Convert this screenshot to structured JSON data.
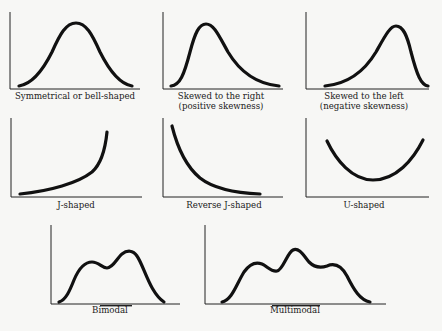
{
  "panels": [
    {
      "id": "symmetrical",
      "label_lines": [
        "Symmetrical or bell-shaped"
      ],
      "shape": "bell"
    },
    {
      "id": "skewed-right",
      "label_lines": [
        "Skewed to the right",
        "(positive skewness)"
      ],
      "shape": "right-skew"
    },
    {
      "id": "skewed-left",
      "label_lines": [
        "Skewed to the left",
        "(negative skewness)"
      ],
      "shape": "left-skew"
    },
    {
      "id": "j-shaped",
      "label_lines": [
        "J-shaped"
      ],
      "shape": "j"
    },
    {
      "id": "reverse-j-shaped",
      "label_lines": [
        "Reverse J-shaped"
      ],
      "shape": "reverse-j"
    },
    {
      "id": "u-shaped",
      "label_lines": [
        "U-shaped"
      ],
      "shape": "u"
    },
    {
      "id": "bimodal",
      "label_lines": [
        "Bimodal"
      ],
      "shape": "bimodal"
    },
    {
      "id": "multimodal",
      "label_lines": [
        "Multimodal"
      ],
      "shape": "multimodal"
    }
  ]
}
